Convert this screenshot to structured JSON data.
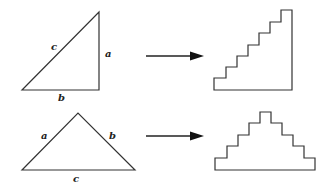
{
  "diagram": {
    "rows": [
      {
        "name": "right-triangle-row",
        "triangle": {
          "type": "right",
          "vertices": [
            [
              22,
              90
            ],
            [
              99,
              12
            ],
            [
              99,
              90
            ]
          ],
          "labels": [
            {
              "text": "c",
              "x": 51,
              "y": 50
            },
            {
              "text": "a",
              "x": 105,
              "y": 57
            },
            {
              "text": "b",
              "x": 58,
              "y": 101
            }
          ]
        },
        "arrow": {
          "x1": 146,
          "y1": 56,
          "x2": 204,
          "y2": 56
        },
        "staircase": {
          "type": "ascending",
          "steps": 7,
          "points": "214,90 214,78 226,78 226,67 237,67 237,56 248,56 248,45 259,45 259,33 270,33 270,22 281,22 281,10 292,10 292,90"
        }
      },
      {
        "name": "isosceles-triangle-row",
        "triangle": {
          "type": "isosceles",
          "vertices": [
            [
              22,
              170
            ],
            [
              78,
              113
            ],
            [
              135,
              170
            ]
          ],
          "labels": [
            {
              "text": "a",
              "x": 41,
              "y": 139
            },
            {
              "text": "b",
              "x": 109,
              "y": 139
            },
            {
              "text": "c",
              "x": 73,
              "y": 182
            }
          ]
        },
        "arrow": {
          "x1": 146,
          "y1": 136,
          "x2": 204,
          "y2": 136
        },
        "staircase": {
          "type": "pyramid",
          "steps": 5,
          "points": "215,170 215,158 227,158 227,146 238,146 238,135 249,135 249,123 260,123 260,112 271,112 271,123 282,123 282,135 293,135 293,146 304,146 304,158 315,158 315,170"
        }
      }
    ],
    "colors": {
      "stroke": "#333333",
      "arrow": "#111111",
      "background": "#ffffff"
    }
  },
  "labels": {
    "top_c": "c",
    "top_a": "a",
    "top_b": "b",
    "bottom_a": "a",
    "bottom_b": "b",
    "bottom_c": "c"
  }
}
